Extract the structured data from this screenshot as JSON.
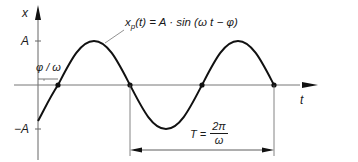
{
  "diagram": {
    "type": "sine-wave-phase-shift",
    "axes": {
      "vertical_label": "x",
      "horizontal_label": "t",
      "amplitude_pos_label": "A",
      "amplitude_neg_label": "−A"
    },
    "formula": {
      "lhs_var": "x",
      "lhs_sub": "p",
      "lhs_arg": "(t) = A · sin (ω t − φ)"
    },
    "phase_shift_label": "φ / ω",
    "period": {
      "lhs": "T =",
      "numerator": "2π",
      "denominator": "ω"
    },
    "colors": {
      "curve": "#111111",
      "axis": "#555555",
      "text": "#1a1a1a",
      "background": "#ffffff"
    }
  }
}
